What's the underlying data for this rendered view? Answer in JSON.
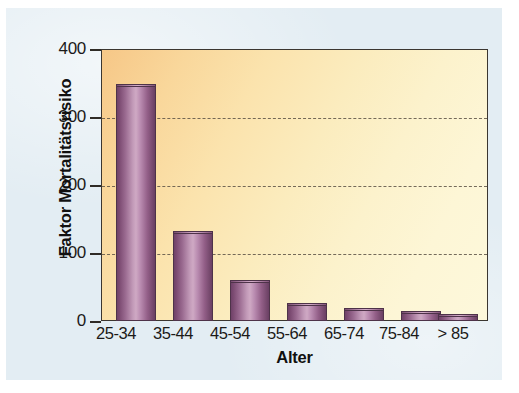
{
  "chart_data": {
    "type": "bar",
    "title": "",
    "xlabel": "Alter",
    "ylabel": "Faktor Mortalitätsrisiko",
    "categories": [
      "25-34",
      "35-44",
      "45-54",
      "55-64",
      "65-74",
      "75-84",
      "> 85"
    ],
    "values": [
      348,
      133,
      61,
      26,
      19,
      14,
      10
    ],
    "ylim": [
      0,
      400
    ],
    "yticks": [
      0,
      100,
      200,
      300,
      400
    ],
    "ytick_labels": [
      "0",
      "100",
      "200",
      "300",
      "400"
    ],
    "grid": "horizontal-dashed",
    "legend": "none",
    "series": [
      {
        "name": "Faktor Mortalitätsrisiko",
        "values": [
          348,
          133,
          61,
          26,
          19,
          14,
          10
        ]
      }
    ]
  },
  "colors": {
    "figure_background": "#e3edf3",
    "page_background": "#ffffff",
    "plot_background_light": "#fdf8db",
    "plot_background_dark": "#f6c787",
    "bar_fill_light": "#cfa9c4",
    "bar_fill_dark": "#6f4268",
    "bar_outline": "#4e3349",
    "axis_line": "#3b3630",
    "gridline": "#5d5346",
    "text": "#1b1a18"
  }
}
